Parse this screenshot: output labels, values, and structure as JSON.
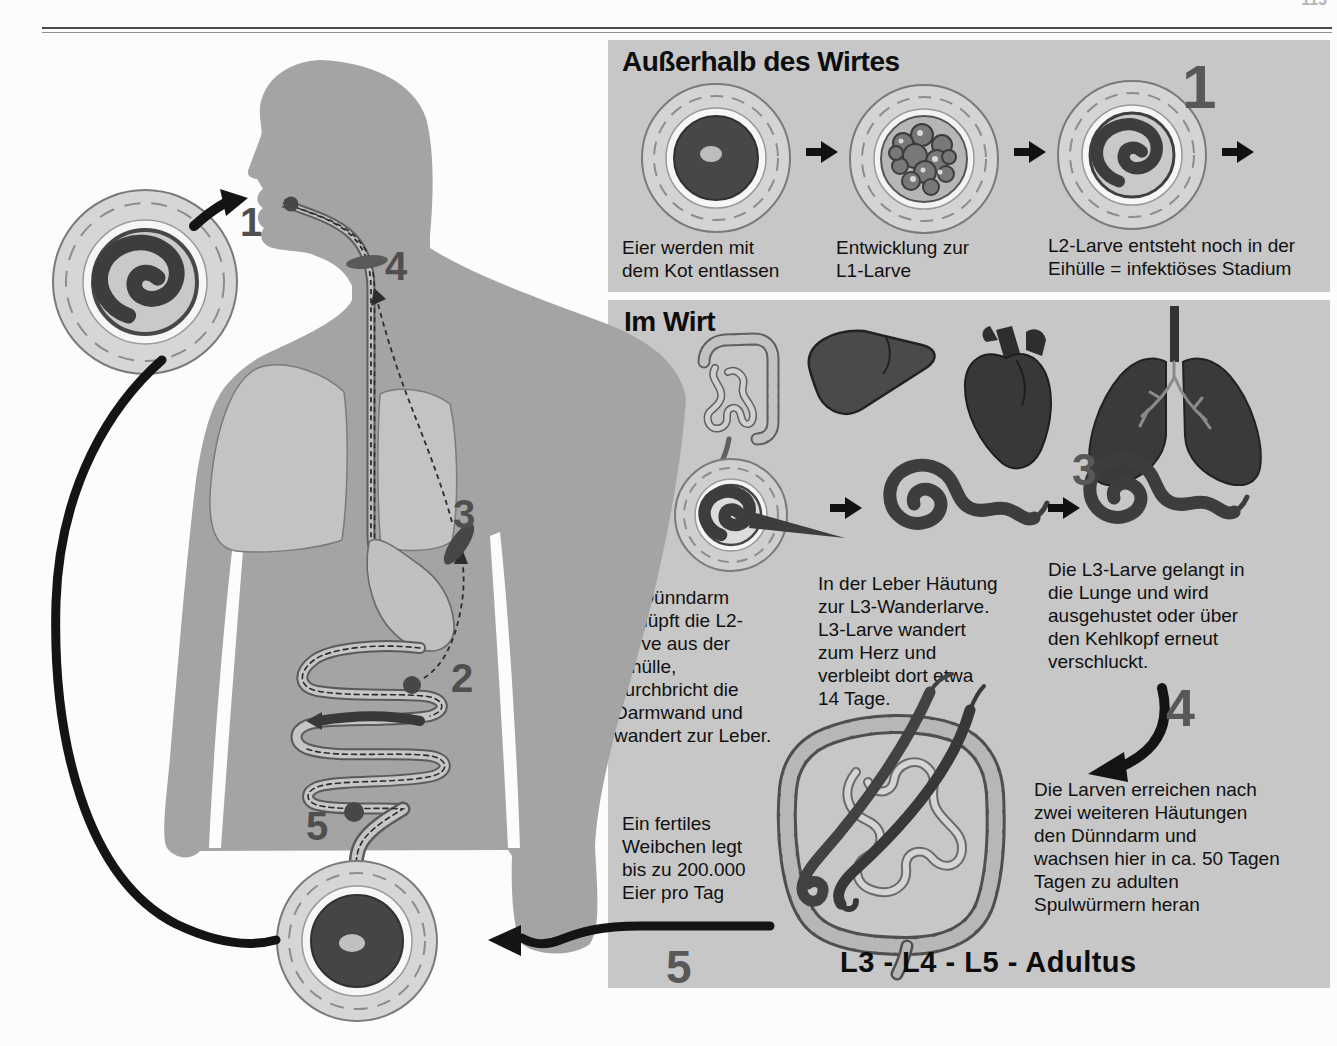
{
  "page": {
    "partial_page_number": "115"
  },
  "left_cycle": {
    "numbers": {
      "n1": "1",
      "n2": "2",
      "n3": "3",
      "n4": "4",
      "n5": "5"
    }
  },
  "panel_outside": {
    "title": "Außerhalb des Wirtes",
    "big_number": "1",
    "captions": {
      "egg_released": "Eier werden mit\ndem Kot entlassen",
      "l1_development": "Entwicklung zur\nL1-Larve",
      "l2_infective": "L2-Larve entsteht noch in der\nEihülle = infektiöses Stadium"
    }
  },
  "panel_host": {
    "title": "Im Wirt",
    "organ_icons": [
      "intestine-icon",
      "liver-icon",
      "heart-icon",
      "lungs-icon"
    ],
    "numbers": {
      "n2": "2",
      "n3": "3",
      "n4": "4",
      "n5": "5"
    },
    "texts": {
      "duodenum": "Im Dünndarm\nschlüpft die L2-\nLarve aus der\nEihülle,\ndurchbricht die\nDarmwand und\nwandert zur Leber.",
      "liver": "In der Leber Häutung\nzur L3-Wanderlarve.\nL3-Larve wandert\nzum Herz und\nverbleibt dort etwa\n14 Tage.",
      "lung": "Die L3-Larve gelangt in\ndie Lunge und wird\nausgehustet oder über\nden Kehlkopf erneut\nverschluckt.",
      "small_intestine": "Die Larven erreichen nach\nzwei weiteren Häutungen\nden Dünndarm und\nwachsen hier in ca. 50 Tagen\nTagen zu adulten\nSpulwürmern heran",
      "fertile_female": "Ein fertiles\nWeibchen legt\nbis zu 200.000\nEier pro Tag"
    },
    "development_label": "L3 - L4 - L5 - Adultus"
  },
  "colors": {
    "panel_bg": "#c7c7c7",
    "body_gray": "#a4a4a4",
    "worm_dark": "#3d3d3d",
    "number_gray": "#585858"
  }
}
